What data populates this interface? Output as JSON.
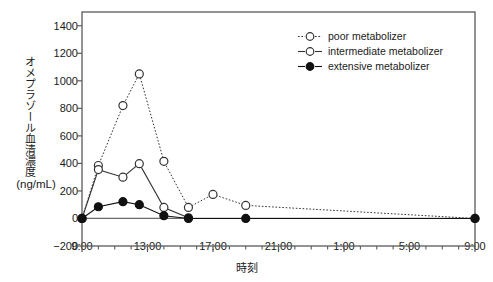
{
  "chart_data": {
    "type": "line",
    "title": "",
    "xlabel": "時刻",
    "ylabel": "オメプラゾール血清濃度",
    "ylabel_units": "(ng/mL)",
    "ylim": [
      -200,
      1500
    ],
    "yticks": [
      -200,
      0,
      200,
      400,
      600,
      800,
      1000,
      1200,
      1400
    ],
    "ytick_labels": [
      "−200",
      "0",
      "200",
      "400",
      "600",
      "800",
      "1000",
      "1200",
      "1400"
    ],
    "xlim": [
      9,
      33
    ],
    "xticks": [
      9,
      13,
      17,
      21,
      25,
      29,
      33
    ],
    "xtick_labels": [
      "9:00",
      "13:00",
      "17:00",
      "21:00",
      "1:00",
      "5:00",
      "9:00"
    ],
    "x_minor_tick_interval_hours": 1,
    "grid": false,
    "legend_position": "top-right",
    "series": [
      {
        "name": "poor metabolizer",
        "marker": "open-circle",
        "line": "dotted",
        "color": "#333333",
        "x": [
          9,
          10,
          11.5,
          12.5,
          14,
          15.5,
          17,
          19,
          33
        ],
        "y": [
          0,
          385,
          820,
          1050,
          415,
          80,
          175,
          95,
          0
        ]
      },
      {
        "name": "intermediate metabolizer",
        "marker": "open-circle",
        "line": "solid",
        "color": "#333333",
        "x": [
          9,
          10,
          11.5,
          12.5,
          14,
          15.5
        ],
        "y": [
          0,
          355,
          300,
          398,
          80,
          5
        ]
      },
      {
        "name": "extensive metabolizer",
        "marker": "filled-circle",
        "line": "solid",
        "color": "#111111",
        "x": [
          9,
          10,
          11.5,
          12.5,
          14,
          15.5,
          19,
          33
        ],
        "y": [
          0,
          85,
          122,
          100,
          20,
          0,
          0,
          0
        ]
      }
    ]
  },
  "legend": {
    "items": [
      {
        "label": "poor metabolizer"
      },
      {
        "label": "intermediate metabolizer"
      },
      {
        "label": "extensive metabolizer"
      }
    ]
  }
}
